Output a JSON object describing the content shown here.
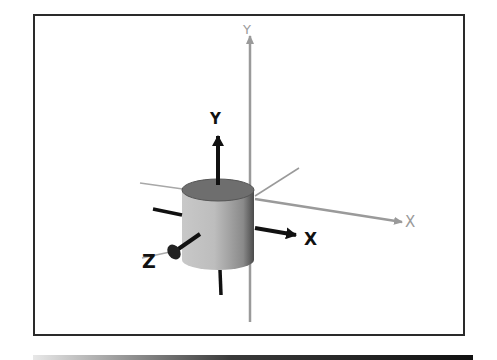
{
  "figure": {
    "world_axes": {
      "x_label": "X",
      "y_label": "Y",
      "color": "#9a9a9a"
    },
    "local_axes": {
      "x_label": "X",
      "y_label": "Y",
      "z_label": "Z",
      "color": "#111111"
    },
    "object": {
      "shape": "cylinder",
      "body_color": "#b8b8b8",
      "top_color": "#6e6e6e",
      "shade_color": "#555555"
    },
    "frame_color": "#2a2a2a"
  }
}
